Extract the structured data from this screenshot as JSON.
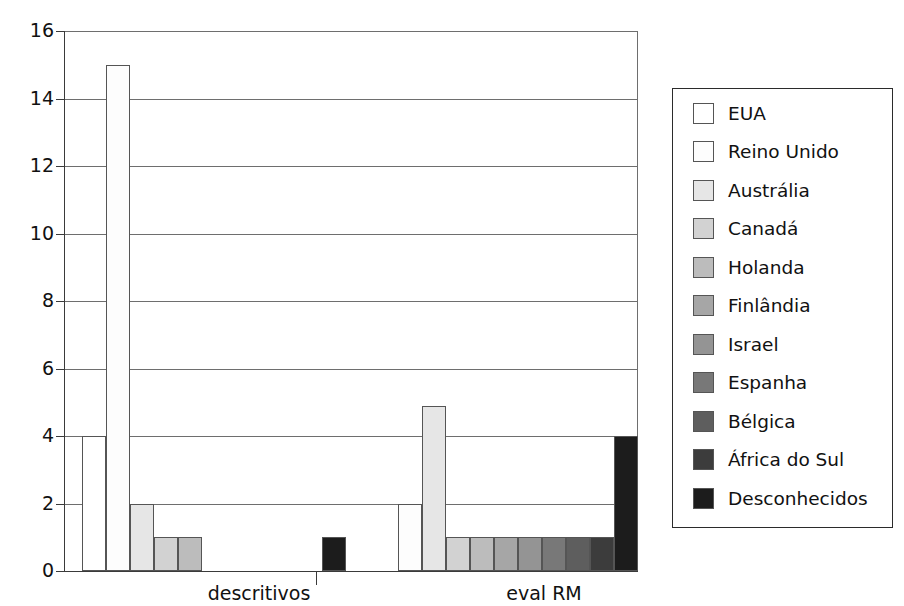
{
  "chart_data": {
    "type": "bar",
    "title": "",
    "subtitle": "",
    "xlabel": "",
    "ylabel": "",
    "categories": [
      "descritivos",
      "eval RM"
    ],
    "ylim": [
      0,
      16
    ],
    "ytick_step": 2,
    "yticks": [
      "16",
      "14",
      "12",
      "10",
      "8",
      "6",
      "4",
      "2",
      "0"
    ],
    "grid": true,
    "legend_position": "right",
    "series": [
      {
        "name": "EUA",
        "color": "#ffffff",
        "values": [
          4,
          0
        ]
      },
      {
        "name": "Reino Unido",
        "color": "#fdfdfd",
        "values": [
          15,
          2
        ]
      },
      {
        "name": "Austrália",
        "color": "#e6e6e6",
        "values": [
          2,
          4.9
        ]
      },
      {
        "name": "Canadá",
        "color": "#d2d2d2",
        "values": [
          1,
          1
        ]
      },
      {
        "name": "Holanda",
        "color": "#bcbcbc",
        "values": [
          1,
          1
        ]
      },
      {
        "name": "Finlândia",
        "color": "#a6a6a6",
        "values": [
          0,
          1
        ]
      },
      {
        "name": "Israel",
        "color": "#949494",
        "values": [
          0,
          1
        ]
      },
      {
        "name": "Espanha",
        "color": "#787878",
        "values": [
          0,
          1
        ]
      },
      {
        "name": "Bélgica",
        "color": "#5e5e5e",
        "values": [
          0,
          1
        ]
      },
      {
        "name": "África do Sul",
        "color": "#3c3c3c",
        "values": [
          0,
          1
        ]
      },
      {
        "name": "Desconhecidos",
        "color": "#1c1c1c",
        "values": [
          1,
          4
        ]
      }
    ]
  },
  "legend": {
    "items": [
      "EUA",
      "Reino Unido",
      "Austrália",
      "Canadá",
      "Holanda",
      "Finlândia",
      "Israel",
      "Espanha",
      "Bélgica",
      "África do Sul",
      "Desconhecidos"
    ]
  }
}
